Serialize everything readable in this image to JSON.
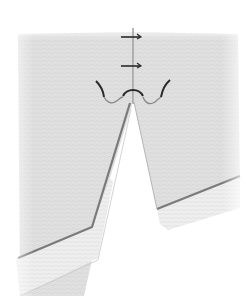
{
  "figure": {
    "colors": {
      "background": "#ffffff",
      "fabric": "#e4e4e4",
      "fabric_texture": "#d2d2d2",
      "hem_fold": "#eeeeee",
      "seam_line": "#7a7a7a",
      "center_line": "#9a9a9a",
      "stitch": "#2a2a2a"
    },
    "elements": {
      "bar_tacks": 2,
      "curved_stitch_loops": 3,
      "panels": [
        "left-panel",
        "right-panel"
      ]
    }
  }
}
